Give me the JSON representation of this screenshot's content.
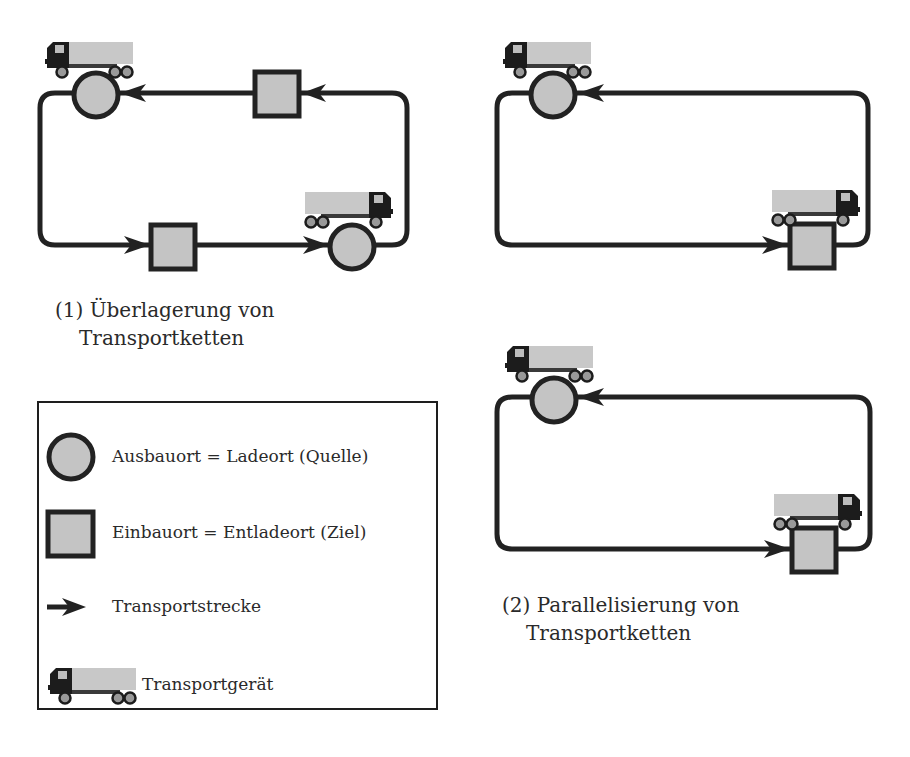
{
  "diagram": {
    "subfigures": [
      {
        "id": "1",
        "caption_line1": "(1) Überlagerung von",
        "caption_line2": "Transportketten",
        "nodes": [
          {
            "type": "source-circle",
            "position": "top-left",
            "has_truck": true
          },
          {
            "type": "target-square",
            "position": "top-middle",
            "has_truck": false
          },
          {
            "type": "target-square",
            "position": "bottom-middle",
            "has_truck": false
          },
          {
            "type": "source-circle",
            "position": "bottom-right",
            "has_truck": true
          }
        ],
        "flow": "clockwise loop: top edge arrows point left, bottom edge arrows point right"
      },
      {
        "id": "2a",
        "caption_line1": "",
        "caption_line2": "",
        "nodes": [
          {
            "type": "source-circle",
            "position": "top-left",
            "has_truck": true
          },
          {
            "type": "target-square",
            "position": "bottom-right",
            "has_truck": true
          }
        ]
      },
      {
        "id": "2b",
        "caption_line1": "(2) Parallelisierung von",
        "caption_line2": "Transportketten",
        "nodes": [
          {
            "type": "source-circle",
            "position": "top-left",
            "has_truck": true
          },
          {
            "type": "target-square",
            "position": "bottom-right",
            "has_truck": true
          }
        ]
      }
    ],
    "legend": {
      "items": [
        {
          "icon": "circle-icon",
          "label": "Ausbauort = Ladeort (Quelle)"
        },
        {
          "icon": "square-icon",
          "label": "Einbauort = Entladeort (Ziel)"
        },
        {
          "icon": "arrow-icon",
          "label": "Transportstrecke"
        },
        {
          "icon": "truck-icon",
          "label": "Transportgerät"
        }
      ]
    },
    "colors": {
      "stroke": "#222222",
      "fill": "#c4c4c4",
      "truck_cab": "#1c1c1c",
      "truck_cargo": "#c8c8c8",
      "background": "#ffffff"
    }
  }
}
